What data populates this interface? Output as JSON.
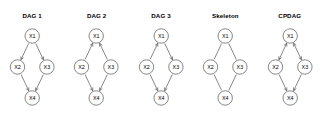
{
  "figure": {
    "background_color": "#ffffff",
    "node_stroke_color": "#555555",
    "edge_color": "#555555",
    "label_color": "#000000",
    "node_radius": 7.2,
    "positions": {
      "X1": {
        "x": 32.2,
        "y": 36
      },
      "X2": {
        "x": 17.5,
        "y": 67
      },
      "X3": {
        "x": 46.9,
        "y": 67
      },
      "X4": {
        "x": 32.2,
        "y": 98
      }
    }
  },
  "panels": [
    {
      "title": "DAG 1",
      "nodes": [
        {
          "id": "X1",
          "label": "X1"
        },
        {
          "id": "X2",
          "label": "X2"
        },
        {
          "id": "X3",
          "label": "X3"
        },
        {
          "id": "X4",
          "label": "X4"
        }
      ],
      "edges": [
        {
          "from": "X1",
          "to": "X2",
          "type": "directed"
        },
        {
          "from": "X1",
          "to": "X3",
          "type": "directed"
        },
        {
          "from": "X2",
          "to": "X4",
          "type": "directed"
        },
        {
          "from": "X3",
          "to": "X4",
          "type": "directed"
        }
      ]
    },
    {
      "title": "DAG 2",
      "nodes": [
        {
          "id": "X1",
          "label": "X1"
        },
        {
          "id": "X2",
          "label": "X2"
        },
        {
          "id": "X3",
          "label": "X3"
        },
        {
          "id": "X4",
          "label": "X4"
        }
      ],
      "edges": [
        {
          "from": "X2",
          "to": "X1",
          "type": "directed"
        },
        {
          "from": "X3",
          "to": "X1",
          "type": "directed"
        },
        {
          "from": "X2",
          "to": "X4",
          "type": "directed"
        },
        {
          "from": "X3",
          "to": "X4",
          "type": "directed"
        }
      ]
    },
    {
      "title": "DAG 3",
      "nodes": [
        {
          "id": "X1",
          "label": "X1"
        },
        {
          "id": "X2",
          "label": "X2"
        },
        {
          "id": "X3",
          "label": "X3"
        },
        {
          "id": "X4",
          "label": "X4"
        }
      ],
      "edges": [
        {
          "from": "X2",
          "to": "X1",
          "type": "directed"
        },
        {
          "from": "X1",
          "to": "X3",
          "type": "directed"
        },
        {
          "from": "X2",
          "to": "X4",
          "type": "directed"
        },
        {
          "from": "X3",
          "to": "X4",
          "type": "directed"
        }
      ]
    },
    {
      "title": "Skeleton",
      "nodes": [
        {
          "id": "X1",
          "label": "X1"
        },
        {
          "id": "X2",
          "label": "X2"
        },
        {
          "id": "X3",
          "label": "X3"
        },
        {
          "id": "X4",
          "label": "X4"
        }
      ],
      "edges": [
        {
          "from": "X1",
          "to": "X2",
          "type": "undirected"
        },
        {
          "from": "X1",
          "to": "X3",
          "type": "undirected"
        },
        {
          "from": "X2",
          "to": "X4",
          "type": "undirected"
        },
        {
          "from": "X3",
          "to": "X4",
          "type": "undirected"
        }
      ]
    },
    {
      "title": "CPDAG",
      "nodes": [
        {
          "id": "X1",
          "label": "X1"
        },
        {
          "id": "X2",
          "label": "X2"
        },
        {
          "id": "X3",
          "label": "X3"
        },
        {
          "id": "X4",
          "label": "X4"
        }
      ],
      "edges": [
        {
          "from": "X1",
          "to": "X2",
          "type": "bidirected"
        },
        {
          "from": "X1",
          "to": "X3",
          "type": "bidirected"
        },
        {
          "from": "X2",
          "to": "X4",
          "type": "directed"
        },
        {
          "from": "X3",
          "to": "X4",
          "type": "directed"
        }
      ]
    }
  ]
}
